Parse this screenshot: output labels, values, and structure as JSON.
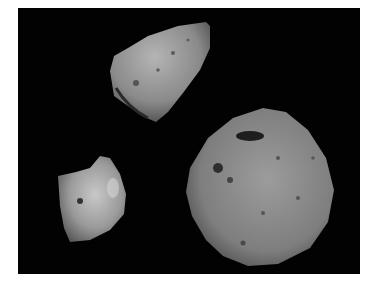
{
  "image": {
    "description": "Three small irregular moons/asteroids against a black background",
    "background_color": "#020202",
    "border_color": "#ffffff",
    "objects": [
      {
        "name": "gaspra",
        "label": "Elongated asteroid (top)",
        "tone": "#8a8a8a"
      },
      {
        "name": "deimos",
        "label": "Small smooth moon (bottom-left)",
        "tone": "#9a9a9a"
      },
      {
        "name": "phobos",
        "label": "Large cratered moon (bottom-right)",
        "tone": "#7e7e7e"
      }
    ]
  }
}
